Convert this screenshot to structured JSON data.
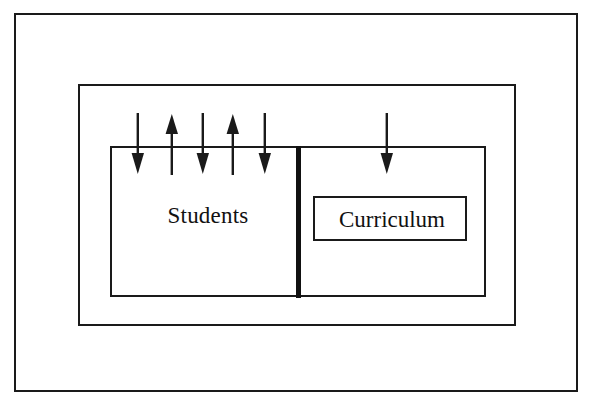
{
  "diagram": {
    "background_color": "#ffffff",
    "line_color": "#1a1a1a",
    "frames": [
      {
        "name": "outer-boundary",
        "label": ""
      },
      {
        "name": "middle-boundary",
        "label": ""
      },
      {
        "name": "inner-boundary",
        "label": ""
      }
    ],
    "regions": {
      "students": {
        "label": "Students",
        "icon": "no-icon"
      },
      "curriculum": {
        "label": "Curriculum",
        "icon": "no-icon"
      }
    },
    "divider": {
      "name": "students-curriculum-divider",
      "orientation": "vertical"
    },
    "arrows": [
      {
        "id": 1,
        "direction": "down",
        "x": 138,
        "icon": "arrow-down-icon"
      },
      {
        "id": 2,
        "direction": "up",
        "x": 172,
        "icon": "arrow-up-icon"
      },
      {
        "id": 3,
        "direction": "down",
        "x": 203,
        "icon": "arrow-down-icon"
      },
      {
        "id": 4,
        "direction": "up",
        "x": 233,
        "icon": "arrow-up-icon"
      },
      {
        "id": 5,
        "direction": "down",
        "x": 265,
        "icon": "arrow-down-icon"
      },
      {
        "id": 6,
        "direction": "down",
        "x": 387,
        "icon": "arrow-down-icon"
      }
    ]
  }
}
